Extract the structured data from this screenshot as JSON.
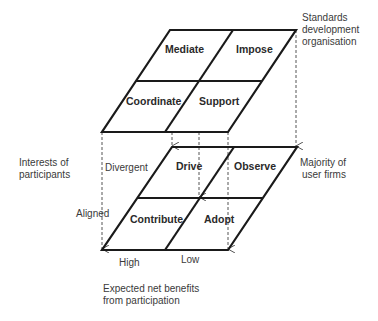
{
  "diagram": {
    "top_layer": {
      "label_lines": [
        "Standards",
        "development",
        "organisation"
      ],
      "cells": {
        "top_left": "Mediate",
        "top_right": "Impose",
        "bottom_left": "Coordinate",
        "bottom_right": "Support"
      }
    },
    "bottom_layer": {
      "label_lines": [
        "Majority of",
        "user firms"
      ],
      "cells": {
        "top_left": "Drive",
        "top_right": "Observe",
        "bottom_left": "Contribute",
        "bottom_right": "Adopt"
      }
    },
    "y_axis": {
      "title_lines": [
        "Interests of",
        "participants"
      ],
      "top": "Divergent",
      "bottom": "Aligned"
    },
    "x_axis": {
      "title_lines": [
        "Expected net benefits",
        "from participation"
      ],
      "left": "High",
      "right": "Low"
    },
    "colors": {
      "line": "#1a1a1a",
      "dashed": "#555555"
    }
  }
}
